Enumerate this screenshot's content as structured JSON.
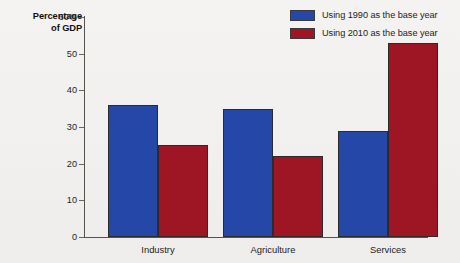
{
  "chart_data": {
    "type": "bar",
    "title": "",
    "xlabel": "",
    "ylabel": "Percentage of GDP",
    "ylabel_line1": "Percentage",
    "ylabel_line2": "of GDP",
    "categories": [
      "Industry",
      "Agriculture",
      "Services"
    ],
    "series": [
      {
        "name": "Using 1990 as the base year",
        "color": "#2447a8",
        "values": [
          36,
          35,
          29
        ]
      },
      {
        "name": "Using 2010 as the base year",
        "color": "#9e1523",
        "values": [
          25,
          22,
          53
        ]
      }
    ],
    "ylim": [
      0,
      60
    ],
    "yticks": [
      0,
      10,
      20,
      30,
      40,
      50,
      60
    ],
    "ytick_labels": [
      "0",
      "10",
      "20",
      "30",
      "40",
      "50",
      "60%"
    ],
    "grid": false,
    "legend_position": "top-right"
  }
}
